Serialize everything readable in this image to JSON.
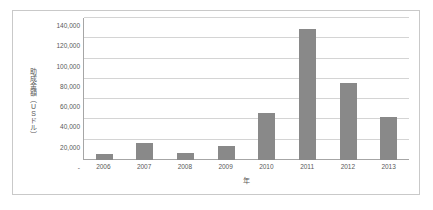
{
  "chart_data": {
    "type": "bar",
    "title": "",
    "xlabel": "年",
    "ylabel": "助成金額（USドル）",
    "categories": [
      "2006",
      "2007",
      "2008",
      "2009",
      "2010",
      "2011",
      "2012",
      "2013"
    ],
    "values": [
      6000,
      16500,
      7000,
      13500,
      46500,
      129500,
      76000,
      42000
    ],
    "ylim": [
      0,
      140000
    ],
    "ytick_values": [
      0,
      20000,
      40000,
      60000,
      80000,
      100000,
      120000,
      140000
    ],
    "ytick_labels": [
      "-",
      "20,000",
      "40,000",
      "60,000",
      "80,000",
      "100,000",
      "120,000",
      "140,000"
    ],
    "grid": true,
    "legend": "none",
    "bar_color": "#898989",
    "gridline_color": "#d4d4d4",
    "axis_color": "#a6a6a6",
    "text_color": "#595959",
    "border_color": "#c9c9c9",
    "background": "#ffffff"
  }
}
